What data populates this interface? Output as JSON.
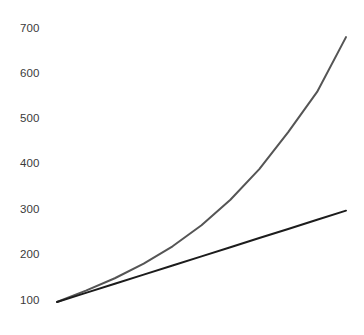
{
  "chart_data": {
    "type": "line",
    "title": "",
    "subtitle": "",
    "xlabel": "",
    "ylabel": "",
    "grid": false,
    "legend": null,
    "legend_position": "none",
    "background_color": "#ffffff",
    "axis_line": false,
    "y_axis": {
      "ticks": [
        100,
        200,
        300,
        400,
        500,
        600,
        700
      ],
      "tick_labels": [
        "100",
        "200",
        "300",
        "400",
        "500",
        "600",
        "700"
      ],
      "ylim": [
        100,
        700
      ],
      "label_color": "#3a3a3a"
    },
    "x_axis": {
      "ticks": [],
      "tick_labels": [],
      "xlim": [
        0,
        10
      ],
      "visible": false
    },
    "series": [
      {
        "name": "exponential-growth",
        "color": "#555555",
        "line_width": 2,
        "style": "solid",
        "x": [
          0,
          1,
          2,
          3,
          4,
          5,
          6,
          7,
          8,
          9,
          10
        ],
        "values": [
          100,
          125,
          152,
          184,
          222,
          268,
          324,
          391,
          472,
          560,
          680
        ]
      },
      {
        "name": "linear-growth",
        "color": "#1c1c1c",
        "line_width": 2,
        "style": "solid",
        "x": [
          0,
          1,
          2,
          3,
          4,
          5,
          6,
          7,
          8,
          9,
          10
        ],
        "values": [
          100,
          120,
          140,
          160,
          180,
          200,
          220,
          240,
          260,
          280,
          300
        ]
      }
    ]
  }
}
